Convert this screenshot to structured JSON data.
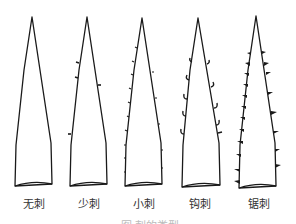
{
  "figure": {
    "type": "spine types diagram",
    "items": [
      {
        "label": "无刺",
        "spine": "none"
      },
      {
        "label": "少刺",
        "spine": "few"
      },
      {
        "label": "小刺",
        "spine": "small"
      },
      {
        "label": "钩刺",
        "spine": "hooked"
      },
      {
        "label": "锯刺",
        "spine": "serrated"
      }
    ],
    "caption": "图 刺的类型"
  },
  "colors": {
    "line": "#1a1a1a",
    "background": "#ffffff"
  }
}
